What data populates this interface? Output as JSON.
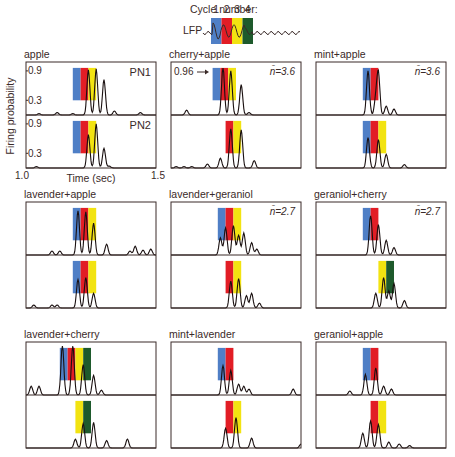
{
  "chart_data": {
    "type": "line",
    "title": "",
    "cycle_header": {
      "label": "Cycle number:",
      "cycles": [
        "1",
        "2",
        "3",
        "4"
      ],
      "lfp_label": "LFP"
    },
    "cycle_colors": {
      "1": "#4f7fc6",
      "2": "#e21d25",
      "3": "#f2e311",
      "4": "#1e5a2c"
    },
    "xlabel": "Time (sec)",
    "ylabel": "Firing probability",
    "xlim": [
      1.0,
      1.5
    ],
    "ylim": [
      0,
      1.0
    ],
    "x_ticks": [
      "1.0",
      "1.5"
    ],
    "y_ticks": [
      "0.9",
      "0.3"
    ],
    "neuron_labels": [
      "PN1",
      "PN2"
    ],
    "panels": [
      {
        "name": "apple",
        "annotation": "",
        "traces": [
          {
            "neuron": "PN1",
            "cycles": [
              1,
              2,
              3
            ],
            "peaks": [
              [
                1.05,
                0.03
              ],
              [
                1.12,
                0.05
              ],
              [
                1.18,
                0.03
              ],
              [
                1.24,
                0.92
              ],
              [
                1.27,
                0.94
              ],
              [
                1.3,
                0.72
              ],
              [
                1.34,
                0.08
              ],
              [
                1.44,
                0.05
              ]
            ]
          },
          {
            "neuron": "PN2",
            "cycles": [
              1,
              2,
              3
            ],
            "peaks": [
              [
                1.04,
                0.03
              ],
              [
                1.24,
                0.68
              ],
              [
                1.27,
                0.9
              ],
              [
                1.3,
                0.4
              ],
              [
                1.32,
                0.04
              ]
            ]
          }
        ]
      },
      {
        "name": "cherry+apple",
        "annotation": "n̄=3.6",
        "callout": "0.96",
        "traces": [
          {
            "neuron": "PN1",
            "cycles": [
              1,
              2,
              3
            ],
            "peaks": [
              [
                1.06,
                0.1
              ],
              [
                1.2,
                0.96
              ],
              [
                1.23,
                0.9
              ],
              [
                1.27,
                0.62
              ],
              [
                1.3,
                0.05
              ]
            ]
          },
          {
            "neuron": "PN2",
            "cycles": [
              2,
              3
            ],
            "peaks": [
              [
                1.02,
                0.03
              ],
              [
                1.05,
                0.03
              ],
              [
                1.08,
                0.03
              ],
              [
                1.14,
                0.08
              ],
              [
                1.19,
                0.2
              ],
              [
                1.23,
                0.8
              ],
              [
                1.27,
                0.78
              ],
              [
                1.32,
                0.15
              ]
            ]
          }
        ]
      },
      {
        "name": "mint+apple",
        "annotation": "n̄=3.6",
        "traces": [
          {
            "neuron": "PN1",
            "cycles": [
              1,
              2
            ],
            "peaks": [
              [
                1.2,
                0.9
              ],
              [
                1.23,
                0.32
              ],
              [
                1.24,
                0.85
              ],
              [
                1.27,
                0.18
              ],
              [
                1.3,
                0.12
              ]
            ]
          },
          {
            "neuron": "PN2",
            "cycles": [
              1,
              2,
              3
            ],
            "peaks": [
              [
                1.2,
                0.62
              ],
              [
                1.24,
                0.58
              ],
              [
                1.27,
                0.28
              ],
              [
                1.34,
                0.07
              ]
            ]
          }
        ]
      },
      {
        "name": "lavender+apple",
        "annotation": "",
        "traces": [
          {
            "neuron": "PN1",
            "cycles": [
              1,
              2,
              3
            ],
            "peaks": [
              [
                1.1,
                0.08
              ],
              [
                1.13,
                0.08
              ],
              [
                1.2,
                0.9
              ],
              [
                1.23,
                0.88
              ],
              [
                1.26,
                0.65
              ],
              [
                1.31,
                0.22
              ],
              [
                1.4,
                0.08
              ],
              [
                1.42,
                0.18
              ],
              [
                1.45,
                0.1
              ],
              [
                1.48,
                0.12
              ]
            ]
          },
          {
            "neuron": "PN2",
            "cycles": [
              1,
              2,
              3
            ],
            "peaks": [
              [
                1.03,
                0.06
              ],
              [
                1.1,
                0.06
              ],
              [
                1.12,
                0.06
              ],
              [
                1.2,
                0.58
              ],
              [
                1.23,
                0.62
              ],
              [
                1.26,
                0.3
              ]
            ]
          }
        ]
      },
      {
        "name": "lavender+geraniol",
        "annotation": "n̄=2.7",
        "traces": [
          {
            "neuron": "PN1",
            "cycles": [
              1,
              2,
              3
            ],
            "peaks": [
              [
                1.19,
                0.35
              ],
              [
                1.21,
                0.55
              ],
              [
                1.24,
                0.6
              ],
              [
                1.26,
                0.4
              ],
              [
                1.28,
                0.45
              ],
              [
                1.31,
                0.25
              ],
              [
                1.33,
                0.12
              ]
            ]
          },
          {
            "neuron": "PN2",
            "cycles": [
              2,
              3
            ],
            "peaks": [
              [
                1.23,
                0.55
              ],
              [
                1.26,
                0.6
              ],
              [
                1.29,
                0.25
              ],
              [
                1.31,
                0.3
              ],
              [
                1.34,
                0.1
              ]
            ]
          }
        ]
      },
      {
        "name": "geraniol+cherry",
        "annotation": "n̄=2.7",
        "traces": [
          {
            "neuron": "PN1",
            "cycles": [
              1,
              2
            ],
            "peaks": [
              [
                1.21,
                0.8
              ],
              [
                1.24,
                0.62
              ],
              [
                1.27,
                0.3
              ],
              [
                1.3,
                0.15
              ]
            ]
          },
          {
            "neuron": "PN2",
            "cycles": [
              3,
              4
            ],
            "peaks": [
              [
                1.23,
                0.3
              ],
              [
                1.26,
                0.62
              ],
              [
                1.28,
                0.35
              ],
              [
                1.3,
                0.5
              ],
              [
                1.34,
                0.15
              ]
            ]
          }
        ]
      },
      {
        "name": "lavender+cherry",
        "annotation": "",
        "traces": [
          {
            "neuron": "PN1",
            "cycles": [
              1,
              2,
              3,
              4
            ],
            "peaks": [
              [
                1.02,
                0.18
              ],
              [
                1.05,
                0.18
              ],
              [
                1.14,
                1.0
              ],
              [
                1.18,
                1.0
              ],
              [
                1.22,
                0.62
              ],
              [
                1.26,
                0.4
              ],
              [
                1.29,
                0.1
              ]
            ]
          },
          {
            "neuron": "PN2",
            "cycles": [
              3,
              4
            ],
            "peaks": [
              [
                1.19,
                0.18
              ],
              [
                1.22,
                0.5
              ],
              [
                1.26,
                0.52
              ],
              [
                1.31,
                0.15
              ],
              [
                1.39,
                0.18
              ]
            ]
          }
        ]
      },
      {
        "name": "mint+lavender",
        "annotation": "",
        "traces": [
          {
            "neuron": "PN1",
            "cycles": [
              1,
              2
            ],
            "peaks": [
              [
                1.2,
                0.6
              ],
              [
                1.23,
                0.5
              ],
              [
                1.26,
                0.22
              ],
              [
                1.28,
                0.18
              ],
              [
                1.3,
                0.12
              ],
              [
                1.47,
                0.12
              ]
            ]
          },
          {
            "neuron": "PN2",
            "cycles": [
              2,
              3
            ],
            "peaks": [
              [
                1.21,
                0.4
              ],
              [
                1.25,
                0.62
              ],
              [
                1.31,
                0.2
              ],
              [
                1.5,
                0.08
              ]
            ]
          }
        ]
      },
      {
        "name": "geraniol+apple",
        "annotation": "",
        "traces": [
          {
            "neuron": "PN1",
            "cycles": [
              1,
              2
            ],
            "peaks": [
              [
                1.13,
                0.08
              ],
              [
                1.19,
                0.42
              ],
              [
                1.23,
                0.55
              ],
              [
                1.26,
                0.18
              ],
              [
                1.29,
                0.12
              ]
            ]
          },
          {
            "neuron": "PN2",
            "cycles": [
              2,
              3
            ],
            "peaks": [
              [
                1.18,
                0.3
              ],
              [
                1.21,
                0.55
              ],
              [
                1.24,
                0.48
              ],
              [
                1.28,
                0.12
              ],
              [
                1.32,
                0.08
              ],
              [
                1.36,
                0.05
              ]
            ]
          }
        ]
      }
    ]
  }
}
